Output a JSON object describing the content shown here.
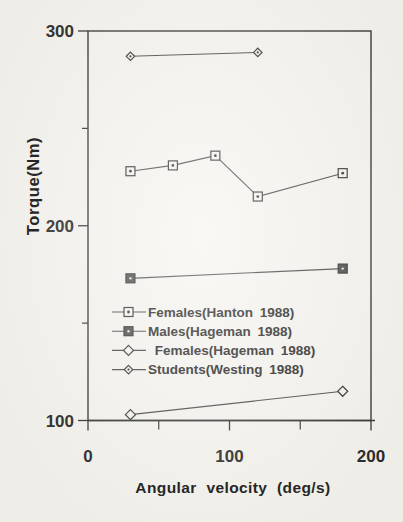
{
  "figure": {
    "background_color": "#f6f4ef",
    "ink_color": "#2f2f2f",
    "line_color": "#454545"
  },
  "chart_data": {
    "type": "line",
    "title": "",
    "xlabel": "Angular velocity (deg/s)",
    "ylabel": "Torque(Nm)",
    "xlim": [
      0,
      200
    ],
    "ylim": [
      100,
      300
    ],
    "x_major_ticks": [
      0,
      100,
      200
    ],
    "x_minor_ticks": [
      50,
      150
    ],
    "y_major_ticks": [
      100,
      200,
      300
    ],
    "y_minor_ticks": [
      150,
      250
    ],
    "grid": false,
    "legend_position": "inside-left-middle",
    "series": [
      {
        "name": "Females(Hanton 1988)",
        "legend_label": "Females(Hanton 1988)",
        "marker": "open-square-dot",
        "x": [
          30,
          60,
          90,
          120,
          180
        ],
        "y": [
          228,
          231,
          236,
          215,
          227
        ]
      },
      {
        "name": "Males(Hageman 1988)",
        "legend_label": "Males(Hageman 1988)",
        "marker": "filled-square-dot",
        "x": [
          30,
          180
        ],
        "y": [
          173,
          178
        ]
      },
      {
        "name": "Females(Hageman 1988)",
        "legend_label": " Females(Hageman 1988)",
        "marker": "open-diamond",
        "x": [
          30,
          180
        ],
        "y": [
          103,
          115
        ]
      },
      {
        "name": "Students(Westing 1988)",
        "legend_label": "Students(Westing 1988)",
        "marker": "small-diamond-dot",
        "x": [
          30,
          120
        ],
        "y": [
          287,
          289
        ]
      }
    ]
  }
}
